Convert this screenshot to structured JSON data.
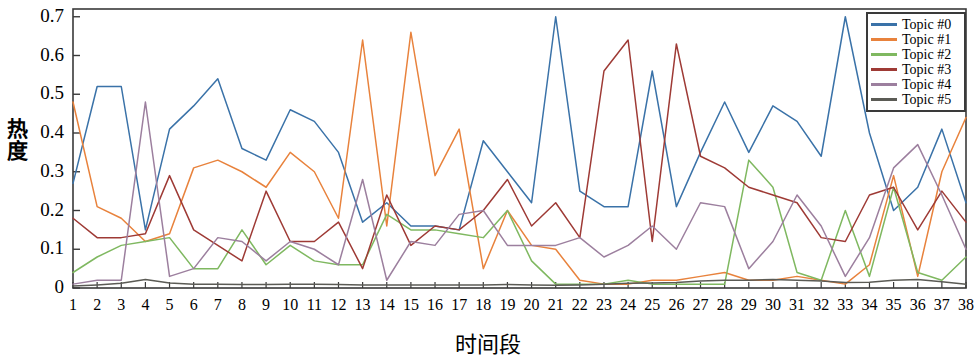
{
  "chart_data": {
    "type": "line",
    "title": "",
    "xlabel": "时间段",
    "ylabel": "热度",
    "xlim": [
      1,
      38
    ],
    "ylim": [
      0,
      0.72
    ],
    "grid": false,
    "legend_position": "upper-right",
    "x": [
      1,
      2,
      3,
      4,
      5,
      6,
      7,
      8,
      9,
      10,
      11,
      12,
      13,
      14,
      15,
      16,
      17,
      18,
      19,
      20,
      21,
      22,
      23,
      24,
      25,
      26,
      27,
      28,
      29,
      30,
      31,
      32,
      33,
      34,
      35,
      36,
      37,
      38
    ],
    "xticklabels": [
      "1",
      "2",
      "3",
      "4",
      "5",
      "6",
      "7",
      "8",
      "9",
      "10",
      "11",
      "12",
      "13",
      "14",
      "15",
      "16",
      "17",
      "18",
      "19",
      "20",
      "21",
      "22",
      "23",
      "24",
      "25",
      "26",
      "27",
      "28",
      "29",
      "30",
      "31",
      "32",
      "33",
      "34",
      "35",
      "36",
      "37",
      "38"
    ],
    "yticklabels": [
      "0",
      "0.1",
      "0.2",
      "0.3",
      "0.4",
      "0.5",
      "0.6",
      "0.7"
    ],
    "ytickvalues": [
      0,
      0.1,
      0.2,
      0.3,
      0.4,
      0.5,
      0.6,
      0.7
    ],
    "series": [
      {
        "name": "Topic #0",
        "color": "#3a72a8",
        "values": [
          0.27,
          0.52,
          0.52,
          0.15,
          0.41,
          0.47,
          0.54,
          0.36,
          0.33,
          0.46,
          0.43,
          0.35,
          0.17,
          0.22,
          0.16,
          0.16,
          0.15,
          0.38,
          0.3,
          0.22,
          0.7,
          0.25,
          0.21,
          0.21,
          0.56,
          0.21,
          0.35,
          0.48,
          0.35,
          0.47,
          0.43,
          0.34,
          0.7,
          0.4,
          0.2,
          0.26,
          0.41,
          0.22
        ]
      },
      {
        "name": "Topic #1",
        "color": "#e8823c",
        "values": [
          0.48,
          0.21,
          0.18,
          0.12,
          0.14,
          0.31,
          0.33,
          0.3,
          0.26,
          0.35,
          0.3,
          0.18,
          0.64,
          0.16,
          0.66,
          0.29,
          0.41,
          0.05,
          0.2,
          0.11,
          0.1,
          0.02,
          0.01,
          0.01,
          0.02,
          0.02,
          0.03,
          0.04,
          0.02,
          0.02,
          0.03,
          0.02,
          0.01,
          0.06,
          0.29,
          0.03,
          0.3,
          0.44
        ]
      },
      {
        "name": "Topic #2",
        "color": "#7fb860",
        "values": [
          0.04,
          0.08,
          0.11,
          0.12,
          0.13,
          0.05,
          0.05,
          0.15,
          0.06,
          0.11,
          0.07,
          0.06,
          0.06,
          0.19,
          0.15,
          0.15,
          0.14,
          0.13,
          0.2,
          0.07,
          0.01,
          0.01,
          0.01,
          0.02,
          0.01,
          0.01,
          0.01,
          0.01,
          0.33,
          0.26,
          0.04,
          0.02,
          0.2,
          0.03,
          0.26,
          0.04,
          0.02,
          0.08
        ]
      },
      {
        "name": "Topic #3",
        "color": "#9e3a35",
        "values": [
          0.18,
          0.13,
          0.13,
          0.14,
          0.29,
          0.15,
          0.11,
          0.07,
          0.25,
          0.12,
          0.12,
          0.17,
          0.05,
          0.24,
          0.11,
          0.16,
          0.15,
          0.2,
          0.28,
          0.16,
          0.22,
          0.13,
          0.56,
          0.64,
          0.12,
          0.63,
          0.34,
          0.31,
          0.26,
          0.24,
          0.22,
          0.13,
          0.12,
          0.24,
          0.26,
          0.15,
          0.25,
          0.17
        ]
      },
      {
        "name": "Topic #4",
        "color": "#9c7f9e",
        "values": [
          0.01,
          0.02,
          0.02,
          0.48,
          0.03,
          0.05,
          0.13,
          0.12,
          0.07,
          0.12,
          0.1,
          0.06,
          0.28,
          0.02,
          0.12,
          0.11,
          0.19,
          0.2,
          0.11,
          0.11,
          0.11,
          0.13,
          0.08,
          0.11,
          0.16,
          0.1,
          0.22,
          0.21,
          0.05,
          0.12,
          0.24,
          0.16,
          0.03,
          0.13,
          0.31,
          0.37,
          0.24,
          0.1
        ]
      },
      {
        "name": "Topic #5",
        "color": "#5b5b55",
        "values": [
          0.005,
          0.008,
          0.012,
          0.022,
          0.013,
          0.01,
          0.01,
          0.009,
          0.009,
          0.01,
          0.01,
          0.009,
          0.008,
          0.008,
          0.008,
          0.008,
          0.008,
          0.008,
          0.009,
          0.008,
          0.007,
          0.008,
          0.01,
          0.012,
          0.013,
          0.014,
          0.018,
          0.02,
          0.02,
          0.022,
          0.02,
          0.018,
          0.014,
          0.015,
          0.02,
          0.022,
          0.016,
          0.01
        ]
      }
    ]
  },
  "legend": {
    "items": [
      {
        "label": "Topic #0"
      },
      {
        "label": "Topic #1"
      },
      {
        "label": "Topic #2"
      },
      {
        "label": "Topic #3"
      },
      {
        "label": "Topic #4"
      },
      {
        "label": "Topic #5"
      }
    ]
  },
  "axes": {
    "ylabel": "热度",
    "xlabel": "时间段"
  }
}
